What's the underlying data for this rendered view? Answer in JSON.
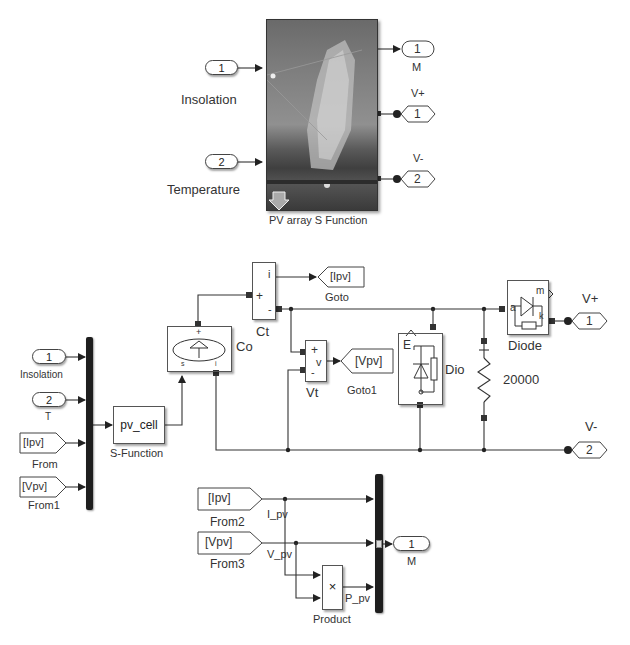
{
  "top_subsystem": {
    "block_label": "PV array S Function",
    "inports": [
      {
        "number": "1",
        "label": "Insolation"
      },
      {
        "number": "2",
        "label": "Temperature"
      }
    ],
    "outports": [
      {
        "number": "1",
        "label": "M"
      },
      {
        "number": "1",
        "label": "V+"
      },
      {
        "number": "2",
        "label": "V-"
      }
    ],
    "mask_icon": "solar-panel-photo"
  },
  "inner_model": {
    "inports": [
      {
        "number": "1",
        "label": "Insolation"
      },
      {
        "number": "2",
        "label": "T"
      }
    ],
    "from_blocks": [
      {
        "tag": "[Ipv]",
        "label": "From"
      },
      {
        "tag": "[Vpv]",
        "label": "From1"
      },
      {
        "tag": "[Ipv]",
        "label": "From2"
      },
      {
        "tag": "[Vpv]",
        "label": "From3"
      }
    ],
    "s_function": {
      "text": "pv_cell",
      "label": "S-Function"
    },
    "controlled_source": {
      "label": "Co",
      "port_left": "s",
      "port_right": "i",
      "port_top": "+"
    },
    "current_sensor": {
      "label": "Ct",
      "ports": [
        "i",
        "+",
        "-"
      ]
    },
    "goto_current": {
      "tag": "[Ipv]",
      "label": "Goto"
    },
    "voltage_sensor": {
      "label": "Vt",
      "ports": [
        "+",
        "v",
        "-"
      ]
    },
    "goto_voltage": {
      "tag": "[Vpv]",
      "label": "Goto1"
    },
    "dio_block": {
      "label": "Dio",
      "port_e": "E",
      "port_k": "k",
      "port_a": "a"
    },
    "resistor": {
      "value": "20000"
    },
    "diode": {
      "label": "Diode",
      "port_a": "a",
      "port_m": "m",
      "port_k": "k"
    },
    "outports": [
      {
        "number": "1",
        "label": "V+"
      },
      {
        "number": "2",
        "label": "V-"
      },
      {
        "number": "1",
        "label": "M"
      }
    ],
    "signal_names": {
      "current": "I_pv",
      "voltage": "V_pv",
      "power": "P_pv"
    },
    "product": {
      "symbol": "×",
      "label": "Product"
    }
  }
}
